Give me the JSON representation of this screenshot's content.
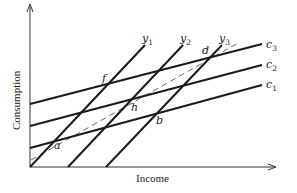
{
  "diagram": {
    "xlabel": "Income",
    "ylabel": "Consumption",
    "income_lines": [
      {
        "name": "y",
        "sub": "1"
      },
      {
        "name": "y",
        "sub": "2"
      },
      {
        "name": "y",
        "sub": "3"
      }
    ],
    "consumption_lines": [
      {
        "name": "c",
        "sub": "3"
      },
      {
        "name": "c",
        "sub": "2"
      },
      {
        "name": "c",
        "sub": "1"
      }
    ],
    "points": {
      "a": "a",
      "b": "b",
      "d": "d",
      "f": "f",
      "h": "h"
    },
    "colors": {
      "line": "#1a1a1a",
      "dashed": "#555555"
    }
  }
}
